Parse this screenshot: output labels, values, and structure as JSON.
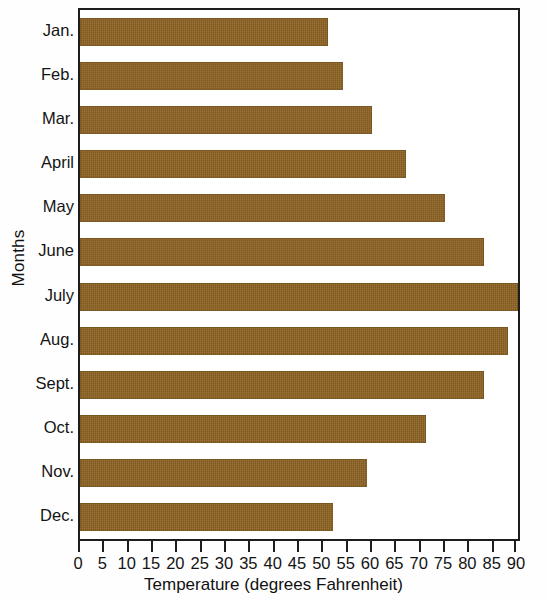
{
  "chart_data": {
    "type": "bar",
    "orientation": "horizontal",
    "title": "",
    "xlabel": "Temperature (degrees Fahrenheit)",
    "ylabel": "Months",
    "categories": [
      "Jan.",
      "Feb.",
      "Mar.",
      "April",
      "May",
      "June",
      "July",
      "Aug.",
      "Sept.",
      "Oct.",
      "Nov.",
      "Dec."
    ],
    "values": [
      51,
      54,
      60,
      67,
      75,
      83,
      90,
      88,
      83,
      71,
      59,
      52
    ],
    "xlim": [
      0,
      90
    ],
    "xticks": [
      0,
      5,
      10,
      15,
      20,
      25,
      30,
      35,
      40,
      45,
      50,
      55,
      60,
      65,
      70,
      75,
      80,
      85,
      90
    ],
    "xtick_labels": [
      "0",
      "5",
      "10",
      "15",
      "20",
      "25",
      "30",
      "35",
      "40",
      "45",
      "50",
      "55",
      "60",
      "65",
      "70",
      "75",
      "80",
      "85",
      "90"
    ],
    "grid": false,
    "legend": null,
    "bar_color": "#8d6223",
    "axis_color": "#1d1d1d",
    "background_color": "#ffffff"
  }
}
